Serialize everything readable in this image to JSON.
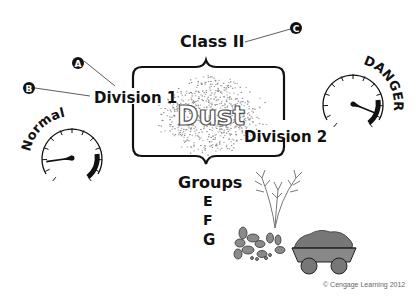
{
  "diagram": {
    "class_label": "Class II",
    "division1_label": "Division 1",
    "division2_label": "Division 2",
    "center_label": "Dust",
    "groups_label": "Groups",
    "groups": [
      "E",
      "F",
      "G"
    ],
    "callouts": [
      "A",
      "B",
      "C"
    ],
    "gauge_left_label": "Normal",
    "gauge_right_label": "DANGER",
    "gauge_left_reading": 0.15,
    "gauge_right_reading": 0.9,
    "copyright": "© Cengage Learning 2012"
  }
}
